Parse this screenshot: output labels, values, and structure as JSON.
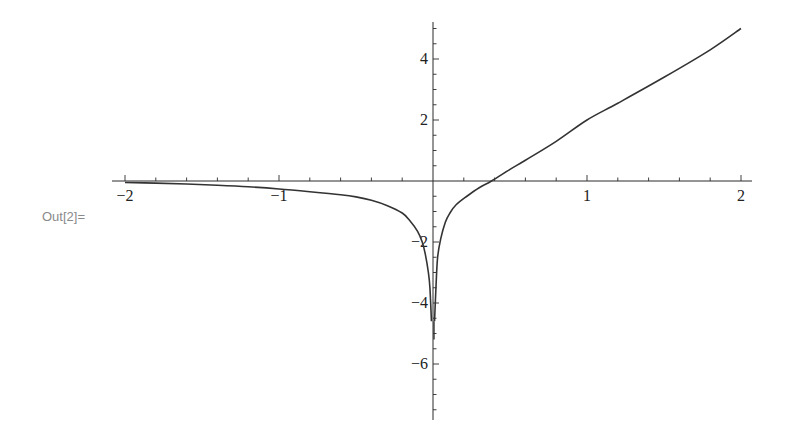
{
  "cell": {
    "output_label": "Out[2]="
  },
  "chart_data": {
    "type": "line",
    "title": "",
    "xlabel": "",
    "ylabel": "",
    "xlim": [
      -2,
      2
    ],
    "ylim": [
      -7.8,
      5.2
    ],
    "grid": false,
    "legend": null,
    "x_ticks": [
      {
        "value": -2,
        "label": "−2"
      },
      {
        "value": -1,
        "label": "−1"
      },
      {
        "value": 1,
        "label": "1"
      },
      {
        "value": 2,
        "label": "2"
      }
    ],
    "y_ticks": [
      {
        "value": 4,
        "label": "4"
      },
      {
        "value": 2,
        "label": "2"
      },
      {
        "value": -2,
        "label": "−2"
      },
      {
        "value": -4,
        "label": "−4"
      },
      {
        "value": -6,
        "label": "−6"
      }
    ],
    "series": [
      {
        "name": "left-branch",
        "x": [
          -2,
          -1.8,
          -1.6,
          -1.4,
          -1.2,
          -1.0,
          -0.8,
          -0.6,
          -0.5,
          -0.4,
          -0.3,
          -0.2,
          -0.15,
          -0.1,
          -0.07,
          -0.05,
          -0.03,
          -0.02,
          -0.01
        ],
        "y": [
          -0.05,
          -0.07,
          -0.1,
          -0.14,
          -0.19,
          -0.26,
          -0.35,
          -0.45,
          -0.52,
          -0.63,
          -0.8,
          -1.05,
          -1.3,
          -1.65,
          -2.0,
          -2.4,
          -3.0,
          -3.5,
          -4.6
        ]
      },
      {
        "name": "right-branch",
        "x": [
          0.01,
          0.02,
          0.03,
          0.05,
          0.08,
          0.11,
          0.15,
          0.22,
          0.3,
          0.38,
          0.5,
          0.6,
          0.8,
          1.0,
          1.2,
          1.5,
          1.8,
          2.0
        ],
        "y": [
          -4.6,
          -3.4,
          -2.5,
          -1.9,
          -1.35,
          -1.05,
          -0.78,
          -0.5,
          -0.22,
          0.0,
          0.38,
          0.68,
          1.3,
          2.0,
          2.55,
          3.4,
          4.3,
          5.0
        ]
      }
    ]
  }
}
